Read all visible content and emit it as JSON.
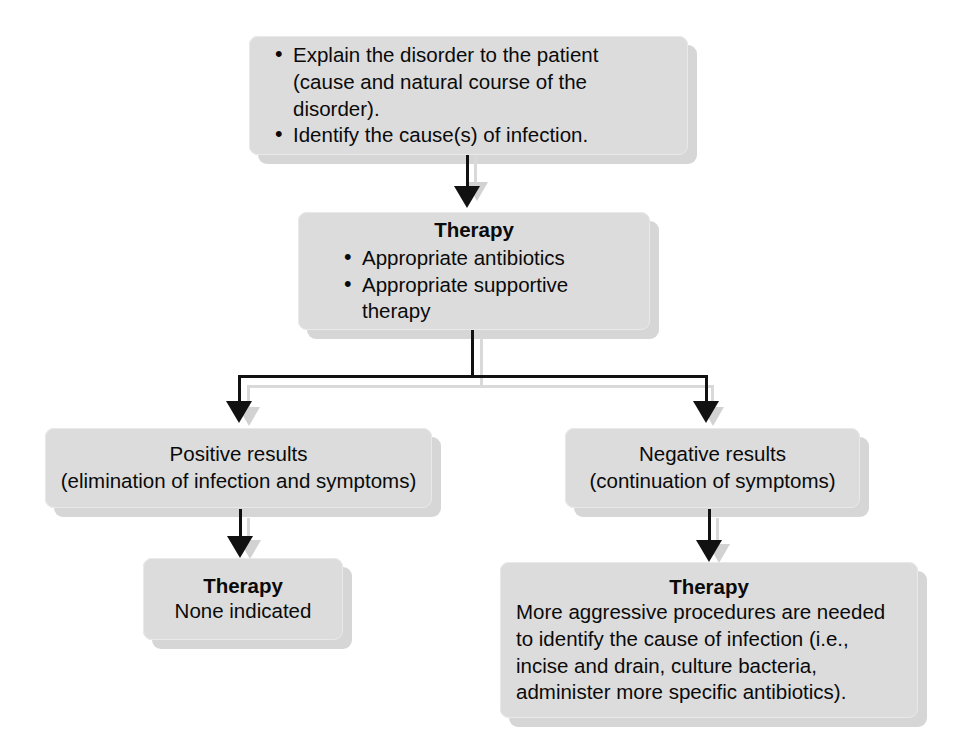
{
  "diagram": {
    "colors": {
      "box_fill": "#dcdcdc",
      "box_shadow": "#cfcfcf",
      "connector": "#111111",
      "text": "#0a0a0a",
      "background": "#ffffff"
    },
    "nodes": {
      "initial_steps": {
        "bullets": [
          {
            "line1": "Explain the disorder to the patient",
            "line2": "(cause and natural course of the disorder)."
          },
          {
            "line1": "Identify the cause(s) of infection.",
            "line2": ""
          }
        ]
      },
      "therapy_main": {
        "title": "Therapy",
        "bullets": [
          "Appropriate antibiotics",
          "Appropriate supportive therapy"
        ]
      },
      "positive_results": {
        "line1": "Positive results",
        "line2": "(elimination of infection and symptoms)"
      },
      "negative_results": {
        "line1": "Negative results",
        "line2": "(continuation of symptoms)"
      },
      "therapy_positive": {
        "title": "Therapy",
        "line1": "None indicated"
      },
      "therapy_negative": {
        "title": "Therapy",
        "line1": "More aggressive procedures are needed",
        "line2": "to identify the cause of infection (i.e.,",
        "line3": "incise and drain, culture bacteria,",
        "line4": "administer more specific antibiotics)."
      }
    },
    "connectors": [
      {
        "name": "initial-to-therapy",
        "type": "arrow-down"
      },
      {
        "name": "therapy-split-left",
        "type": "elbow-arrow-down"
      },
      {
        "name": "therapy-split-right",
        "type": "elbow-arrow-down"
      },
      {
        "name": "positive-to-therapy",
        "type": "arrow-down"
      },
      {
        "name": "negative-to-therapy",
        "type": "arrow-down"
      }
    ]
  }
}
